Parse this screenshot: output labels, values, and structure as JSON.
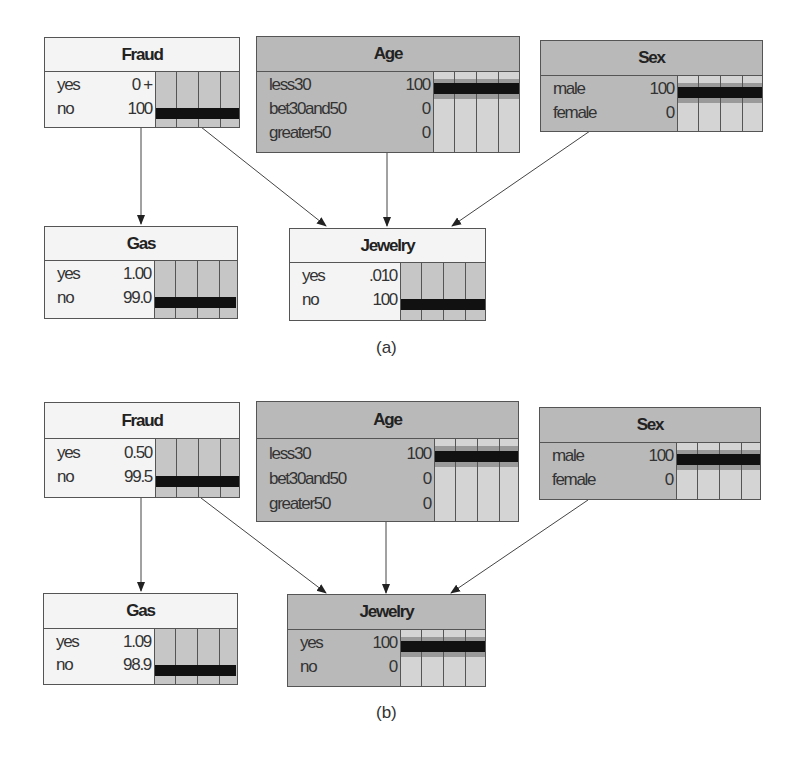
{
  "panels": [
    {
      "caption": "(a)",
      "nodes": {
        "fraud": {
          "title": "Fraud",
          "states": [
            {
              "label": "yes",
              "value": "0 +"
            },
            {
              "label": "no",
              "value": "100"
            }
          ]
        },
        "age": {
          "title": "Age",
          "states": [
            {
              "label": "less30",
              "value": "100"
            },
            {
              "label": "bet30and50",
              "value": "0"
            },
            {
              "label": "greater50",
              "value": "0"
            }
          ]
        },
        "sex": {
          "title": "Sex",
          "states": [
            {
              "label": "male",
              "value": "100"
            },
            {
              "label": "female",
              "value": "0"
            }
          ]
        },
        "gas": {
          "title": "Gas",
          "states": [
            {
              "label": "yes",
              "value": "1.00"
            },
            {
              "label": "no",
              "value": "99.0"
            }
          ]
        },
        "jewelry": {
          "title": "Jewelry",
          "states": [
            {
              "label": "yes",
              "value": ".010"
            },
            {
              "label": "no",
              "value": "100"
            }
          ]
        }
      }
    },
    {
      "caption": "(b)",
      "nodes": {
        "fraud": {
          "title": "Fraud",
          "states": [
            {
              "label": "yes",
              "value": "0.50"
            },
            {
              "label": "no",
              "value": "99.5"
            }
          ]
        },
        "age": {
          "title": "Age",
          "states": [
            {
              "label": "less30",
              "value": "100"
            },
            {
              "label": "bet30and50",
              "value": "0"
            },
            {
              "label": "greater50",
              "value": "0"
            }
          ]
        },
        "sex": {
          "title": "Sex",
          "states": [
            {
              "label": "male",
              "value": "100"
            },
            {
              "label": "female",
              "value": "0"
            }
          ]
        },
        "gas": {
          "title": "Gas",
          "states": [
            {
              "label": "yes",
              "value": "1.09"
            },
            {
              "label": "no",
              "value": "98.9"
            }
          ]
        },
        "jewelry": {
          "title": "Jewelry",
          "states": [
            {
              "label": "yes",
              "value": "100"
            },
            {
              "label": "no",
              "value": "0"
            }
          ]
        }
      }
    }
  ],
  "edges": [
    {
      "from": "Fraud",
      "to": "Gas"
    },
    {
      "from": "Fraud",
      "to": "Jewelry"
    },
    {
      "from": "Age",
      "to": "Jewelry"
    },
    {
      "from": "Sex",
      "to": "Jewelry"
    }
  ],
  "colors": {
    "evidence_node": "#b9b9b9",
    "normal_node": "#f4f4f4",
    "bar": "#111111",
    "line": "#555555"
  }
}
